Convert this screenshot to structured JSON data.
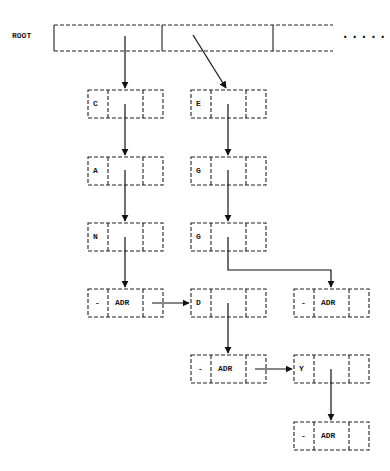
{
  "diagram": {
    "root_label": "ROOT",
    "continuation": ".....",
    "nodes": [
      {
        "id": "c",
        "key": "C",
        "data": "",
        "row": 1,
        "col": 1
      },
      {
        "id": "a",
        "key": "A",
        "data": "",
        "row": 2,
        "col": 1
      },
      {
        "id": "n",
        "key": "N",
        "data": "",
        "row": 3,
        "col": 1
      },
      {
        "id": "end1",
        "key": "-",
        "data": "ADR",
        "row": 4,
        "col": 1
      },
      {
        "id": "e",
        "key": "E",
        "data": "",
        "row": 1,
        "col": 2
      },
      {
        "id": "g1",
        "key": "G",
        "data": "",
        "row": 2,
        "col": 2
      },
      {
        "id": "g2",
        "key": "G",
        "data": "",
        "row": 3,
        "col": 2
      },
      {
        "id": "d",
        "key": "D",
        "data": "",
        "row": 4,
        "col": 2
      },
      {
        "id": "end2",
        "key": "-",
        "data": "ADR",
        "row": 4,
        "col": 3
      },
      {
        "id": "end3",
        "key": "-",
        "data": "ADR",
        "row": 5,
        "col": 2
      },
      {
        "id": "y",
        "key": "Y",
        "data": "",
        "row": 5,
        "col": 3
      },
      {
        "id": "end4",
        "key": "-",
        "data": "ADR",
        "row": 6,
        "col": 3
      }
    ],
    "edges": [
      {
        "from": "root-cell-1",
        "to": "c"
      },
      {
        "from": "root-cell-2",
        "to": "e"
      },
      {
        "from": "c",
        "to": "a"
      },
      {
        "from": "a",
        "to": "n"
      },
      {
        "from": "n",
        "to": "end1"
      },
      {
        "from": "end1",
        "to": "d"
      },
      {
        "from": "e",
        "to": "g1"
      },
      {
        "from": "g1",
        "to": "g2"
      },
      {
        "from": "g2",
        "to": "end2"
      },
      {
        "from": "d",
        "to": "end3"
      },
      {
        "from": "end3",
        "to": "y"
      },
      {
        "from": "y",
        "to": "end4"
      }
    ]
  }
}
